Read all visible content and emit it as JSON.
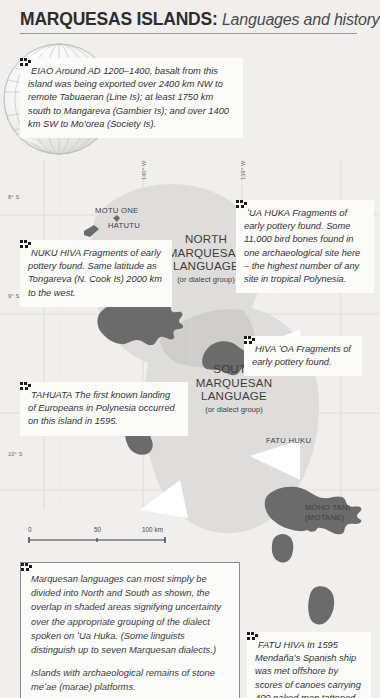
{
  "header": {
    "title_bold": "MARQUESAS ISLANDS:",
    "title_italic": " Languages and history"
  },
  "callouts": {
    "eiao": {
      "name": "EIAO",
      "text": "EIAO Around AD 1200–1400, basalt from this island was being exported over 2400 km NW to remote Tabuaeran (Line Is); at least 1750 km south to Mangareva (Gambier Is); and over 1400 km SW to Mo’orea (Society Is)."
    },
    "nuku_hiva": {
      "name": "NUKU HIVA",
      "text": "NUKU HIVA Fragments of early pottery found. Same latitude as Tongareva (N. Cook Is) 2000 km to the west."
    },
    "ua_huka": {
      "name": "ʻUA HUKA",
      "text": "ʻUA HUKA Fragments of early pottery found. Some 11,000 bird bones found in one archaeological site here – the highest number of any site in tropical Polynesia."
    },
    "hiva_oa": {
      "name": "HIVA ʻOA",
      "text": "HIVA ʻOA Fragments of early pottery found."
    },
    "tahuata": {
      "name": "TAHUATA",
      "text": "TAHUATA The first known landing of Europeans in Polynesia occurred on this island in 1595."
    },
    "fatu_hiva": {
      "name": "FATU HIVA",
      "text": "FATU HIVA In 1595 Mendaña’s Spanish ship was met offshore by scores of canoes carrying 400 naked men tattooed in blue."
    }
  },
  "language_zones": [
    {
      "id": "north",
      "line1": "NORTH",
      "line2": "MARQUESAN",
      "line3": "LANGUAGE",
      "sub": "(or dialect group)"
    },
    {
      "id": "south",
      "line1": "SOUTH",
      "line2": "MARQUESAN",
      "line3": "LANGUAGE",
      "sub": "(or dialect group)"
    }
  ],
  "island_labels": [
    {
      "id": "motu-one",
      "text": "MOTU ONE"
    },
    {
      "id": "hatutu",
      "text": "HATUTU"
    },
    {
      "id": "ua-pou",
      "text": "ʻUA POU"
    },
    {
      "id": "fatu-huku",
      "text": "FATU HUKU"
    },
    {
      "id": "moho-tani-1",
      "text": "MOHO TANI"
    },
    {
      "id": "moho-tani-2",
      "text": "(MOTANE)"
    }
  ],
  "graticule": {
    "latitudes": [
      "8° S",
      "9° S",
      "10° S"
    ],
    "longitudes": [
      "140° W",
      "139° W"
    ]
  },
  "scalebar": {
    "ticks": [
      "0",
      "50",
      "100 km"
    ]
  },
  "legend": {
    "paragraph1": "Marquesan languages can most simply be divided into North and South as shown, the overlap in shaded areas signifying uncertainty over the appropriate grouping of the dialect spoken on  ʻUa Huka. (Some linguists distinguish up to seven Marquesan dialects.)",
    "paragraph2": "Islands with archaeological remains of stone meʻae (marae) platforms."
  },
  "colors": {
    "page_background": "#f0efee",
    "box_background": "#fbfbfa",
    "text": "#333333",
    "rule": "#9a9a9a",
    "island_fill": "#6b6b6b",
    "zone_fill": "#dedddb",
    "zone_overlap": "#cfcecb",
    "graticule": "#d9d8d6"
  },
  "icons": {
    "marker": "archaeological-marae-marker",
    "globe": "globe-inset-icon"
  }
}
